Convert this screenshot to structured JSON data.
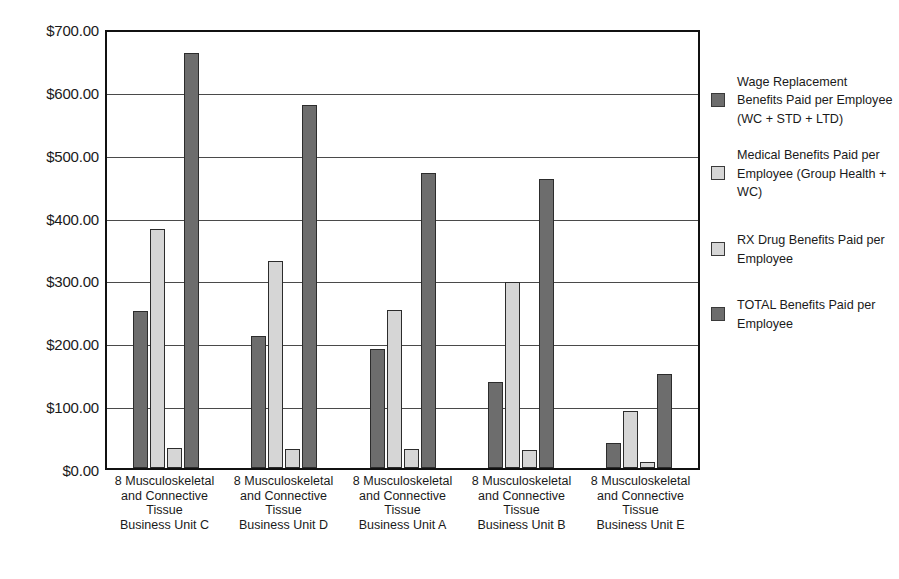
{
  "chart_data": {
    "type": "bar",
    "title": "",
    "xlabel": "",
    "ylabel": "",
    "ylim": [
      0,
      700
    ],
    "ytick_labels": [
      "$700.00",
      "$600.00",
      "$500.00",
      "$400.00",
      "$300.00",
      "$200.00",
      "$100.00",
      "$0.00"
    ],
    "ytick_values": [
      700,
      600,
      500,
      400,
      300,
      200,
      100,
      0
    ],
    "grid": true,
    "legend_position": "right",
    "categories": [
      "8 Musculoskeletal and Connective Tissue Business Unit C",
      "8 Musculoskeletal and Connective Tissue Business Unit D",
      "8 Musculoskeletal and Connective Tissue Business Unit A",
      "8 Musculoskeletal and Connective Tissue Business Unit B",
      "8 Musculoskeletal and Connective Tissue Business Unit E"
    ],
    "category_lines": [
      [
        "8 Musculoskeletal",
        "and Connective",
        "Tissue",
        "Business Unit C"
      ],
      [
        "8 Musculoskeletal",
        "and Connective",
        "Tissue",
        "Business Unit D"
      ],
      [
        "8 Musculoskeletal",
        "and Connective",
        "Tissue",
        "Business Unit A"
      ],
      [
        "8 Musculoskeletal",
        "and Connective",
        "Tissue",
        "Business Unit B"
      ],
      [
        "8 Musculoskeletal",
        "and Connective",
        "Tissue",
        "Business Unit E"
      ]
    ],
    "series": [
      {
        "name": "Wage Replacement Benefits Paid per Employee (WC + STD + LTD)",
        "color": "#6d6d6d",
        "values": [
          250,
          210,
          190,
          137,
          40
        ]
      },
      {
        "name": "Medical Benefits Paid per Employee (Group Health + WC)",
        "color": "#d6d6d6",
        "values": [
          380,
          330,
          252,
          296,
          90
        ]
      },
      {
        "name": "RX Drug Benefits Paid per Employee",
        "color": "#d6d6d6",
        "values": [
          32,
          30,
          30,
          29,
          10
        ]
      },
      {
        "name": "TOTAL Benefits Paid per Employee",
        "color": "#6d6d6d",
        "values": [
          660,
          577,
          470,
          460,
          150
        ]
      }
    ]
  },
  "legend": {
    "items": [
      {
        "label": "Wage Replacement Benefits Paid per Employee (WC + STD + LTD)",
        "swatch": "dark"
      },
      {
        "label": "Medical Benefits Paid per Employee (Group Health + WC)",
        "swatch": "light"
      },
      {
        "label": "RX Drug Benefits Paid per Employee",
        "swatch": "light"
      },
      {
        "label": "TOTAL Benefits Paid per Employee",
        "swatch": "dark"
      }
    ]
  }
}
